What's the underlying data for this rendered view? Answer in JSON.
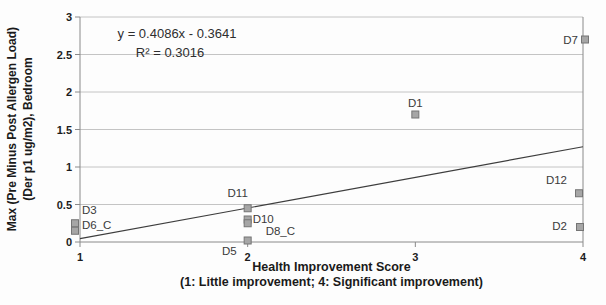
{
  "chart_data": {
    "type": "scatter",
    "title": "",
    "xlabel": "Health Improvement Score",
    "xlabel_note": "(1: Little improvement; 4: Significant improvement)",
    "ylabel": "Max (Pre Minus Post Allergen Load)",
    "ylabel_note": "(Der p1 ug/m2), Bedroom",
    "xlim": [
      1,
      4
    ],
    "ylim": [
      0,
      3
    ],
    "x_ticks": [
      1,
      2,
      3,
      4
    ],
    "x_tick_labels": [
      "1",
      "2",
      "3",
      "4"
    ],
    "y_ticks": [
      0,
      0.5,
      1,
      1.5,
      2,
      2.5,
      3
    ],
    "y_tick_labels": [
      "0",
      "0.5",
      "1",
      "1.5",
      "2",
      "2.5",
      "3"
    ],
    "grid": "horizontal-only",
    "legend": "none",
    "marker_style": "gray-square",
    "trendline": {
      "type": "linear",
      "slope": 0.4086,
      "intercept": -0.3641,
      "equation_text": "y = 0.4086x - 0.3641",
      "r_squared_text": "R² = 0.3016",
      "r_squared": 0.3016
    },
    "points": [
      {
        "label": "D3",
        "x": 1,
        "y": 0.25,
        "anchor": "start",
        "ldx": 7,
        "ldy": -9,
        "mdx": -5
      },
      {
        "label": "D6_C",
        "x": 1,
        "y": 0.15,
        "anchor": "start",
        "ldx": 7,
        "ldy": -2,
        "mdx": -5
      },
      {
        "label": "D11",
        "x": 2,
        "y": 0.45,
        "anchor": "middle",
        "ldx": -10,
        "ldy": -11,
        "mdx": 0
      },
      {
        "label": "D10",
        "x": 2,
        "y": 0.3,
        "anchor": "start",
        "ldx": 5,
        "ldy": 3,
        "mdx": 0
      },
      {
        "label": "D8_C",
        "x": 2,
        "y": 0.25,
        "anchor": "start",
        "ldx": 18,
        "ldy": 12,
        "mdx": 0
      },
      {
        "label": "D5",
        "x": 2,
        "y": 0.02,
        "anchor": "end",
        "ldx": -11,
        "ldy": 14,
        "mdx": 0
      },
      {
        "label": "D1",
        "x": 3,
        "y": 1.7,
        "anchor": "middle",
        "ldx": 0,
        "ldy": -8,
        "mdx": 0
      },
      {
        "label": "D7",
        "x": 4,
        "y": 2.7,
        "anchor": "end",
        "ldx": -7,
        "ldy": 4,
        "mdx": 2
      },
      {
        "label": "D12",
        "x": 4,
        "y": 0.65,
        "anchor": "end",
        "ldx": -12,
        "ldy": -9,
        "mdx": -4
      },
      {
        "label": "D2",
        "x": 4,
        "y": 0.2,
        "anchor": "end",
        "ldx": -13,
        "ldy": 3,
        "mdx": -3
      }
    ],
    "colors": {
      "marker_fill": "#a6a6a6",
      "marker_stroke": "#757575",
      "gridline": "#c4c4c4",
      "axis": "#8a8a8a",
      "trendline": "#3d3d3d",
      "tick_text": "#1c1c1c",
      "point_label_text": "#3a3a3a",
      "equation_text": "#2e2e2e"
    }
  }
}
